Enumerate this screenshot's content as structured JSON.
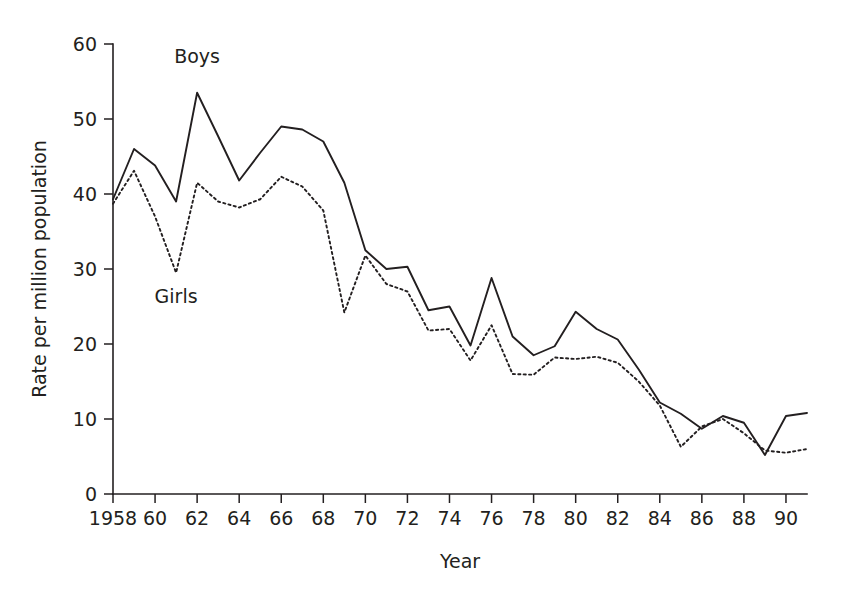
{
  "chart_data": {
    "type": "line",
    "title": "",
    "xlabel": "Year",
    "ylabel": "Rate per million population",
    "xlim": [
      1958,
      1991
    ],
    "ylim": [
      0,
      60
    ],
    "grid": false,
    "legend_position": "inline-annotation",
    "x_tick_labels": [
      "1958",
      "60",
      "62",
      "64",
      "66",
      "68",
      "70",
      "72",
      "74",
      "76",
      "78",
      "80",
      "82",
      "84",
      "86",
      "88",
      "90"
    ],
    "x_tick_values": [
      1958,
      1960,
      1962,
      1964,
      1966,
      1968,
      1970,
      1972,
      1974,
      1976,
      1978,
      1980,
      1982,
      1984,
      1986,
      1988,
      1990
    ],
    "y_tick_labels": [
      "0",
      "10",
      "20",
      "30",
      "40",
      "50",
      "60"
    ],
    "y_tick_values": [
      0,
      10,
      20,
      30,
      40,
      50,
      60
    ],
    "x": [
      1958,
      1959,
      1960,
      1961,
      1962,
      1963,
      1964,
      1965,
      1966,
      1967,
      1968,
      1969,
      1970,
      1971,
      1972,
      1973,
      1974,
      1975,
      1976,
      1977,
      1978,
      1979,
      1980,
      1981,
      1982,
      1983,
      1984,
      1985,
      1986,
      1987,
      1988,
      1989,
      1990,
      1991
    ],
    "series": [
      {
        "name": "Boys",
        "style": "solid",
        "color": "#231f20",
        "label_x": 1962.0,
        "label_y": 57.5,
        "values": [
          39.3,
          46.0,
          43.8,
          39.0,
          53.5,
          47.7,
          41.8,
          45.5,
          49.0,
          48.6,
          47.0,
          41.5,
          32.5,
          30.0,
          30.3,
          24.5,
          25.0,
          19.8,
          28.8,
          21.0,
          18.5,
          19.7,
          24.3,
          22.0,
          20.6,
          16.6,
          12.2,
          10.7,
          8.7,
          10.4,
          9.5,
          5.2,
          10.4,
          10.8
        ]
      },
      {
        "name": "Girls",
        "style": "dotted",
        "color": "#231f20",
        "label_x": 1961.0,
        "label_y": 25.5,
        "values": [
          38.7,
          43.1,
          37.0,
          29.5,
          41.5,
          39.0,
          38.2,
          39.3,
          42.3,
          41.0,
          37.8,
          24.2,
          31.8,
          28.0,
          27.0,
          21.8,
          22.0,
          17.8,
          22.5,
          16.0,
          15.9,
          18.2,
          18.0,
          18.3,
          17.5,
          15.0,
          11.8,
          6.3,
          9.0,
          10.0,
          8.1,
          5.8,
          5.5,
          6.0
        ]
      }
    ]
  }
}
